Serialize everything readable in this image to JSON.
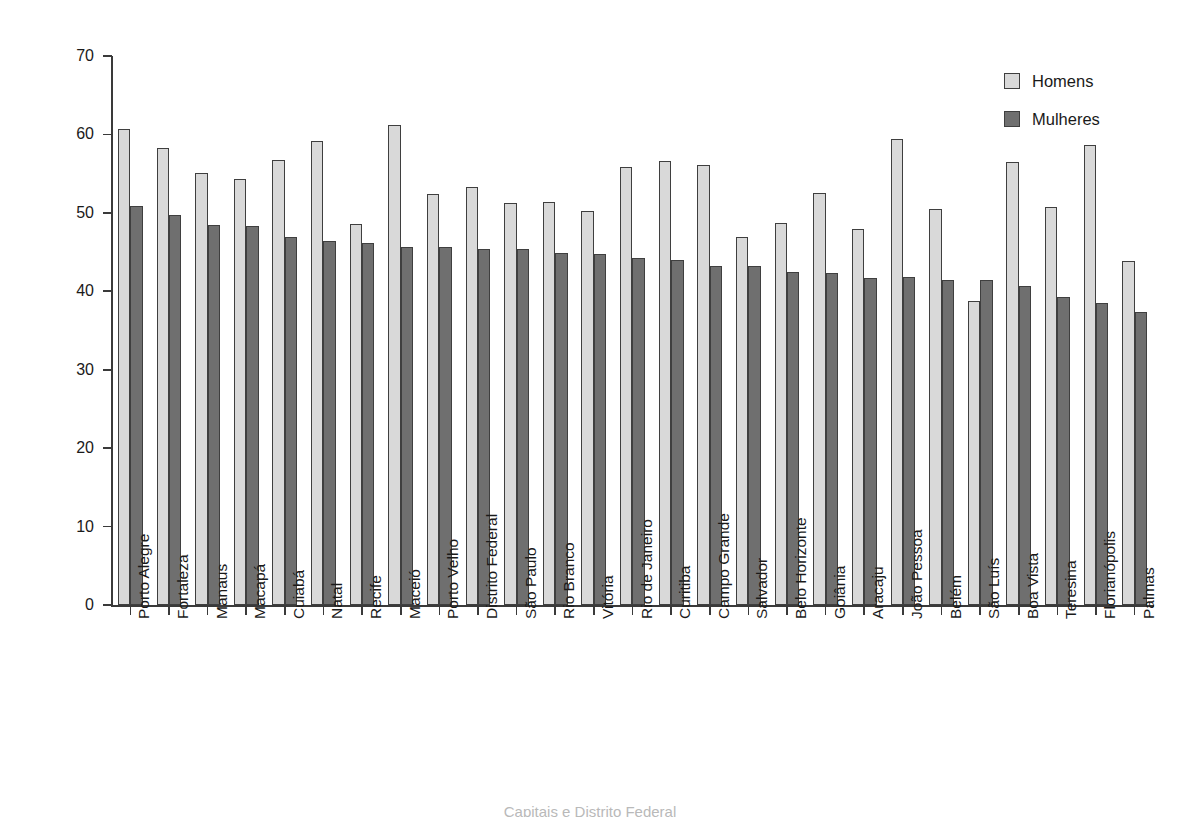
{
  "chart_data": {
    "type": "bar",
    "title": "",
    "subtitle": "",
    "xlabel": "",
    "ylabel": "Percentual",
    "ylim": [
      0,
      70
    ],
    "yticks": [
      0,
      10,
      20,
      30,
      40,
      50,
      60,
      70
    ],
    "grid": false,
    "legend_position": "top-right",
    "categories": [
      "Porto Alegre",
      "Fortaleza",
      "Manaus",
      "Macapá",
      "Cuiabá",
      "Natal",
      "Recife",
      "Maceió",
      "Porto Velho",
      "Distrito Federal",
      "São Paulo",
      "Rio Branco",
      "Vitória",
      "Rio de Janeiro",
      "Curitiba",
      "Campo Grande",
      "Salvador",
      "Belo Horizonte",
      "Goiânia",
      "Aracaju",
      "João Pessoa",
      "Belém",
      "São Luís",
      "Boa Vista",
      "Teresina",
      "Florianópolis",
      "Palmas"
    ],
    "series": [
      {
        "name": "Homens",
        "color": "#d9d9d9",
        "values": [
          60.7,
          58.3,
          55.1,
          54.3,
          56.8,
          59.2,
          48.6,
          61.2,
          52.4,
          53.3,
          51.2,
          51.4,
          50.3,
          55.9,
          56.6,
          56.1,
          46.9,
          48.7,
          52.5,
          47.9,
          59.4,
          50.5,
          38.7,
          56.5,
          50.7,
          58.7,
          43.8
        ]
      },
      {
        "name": "Mulheres",
        "color": "#6f6f6f",
        "values": [
          50.9,
          49.7,
          48.4,
          48.3,
          46.9,
          46.4,
          46.2,
          45.6,
          45.7,
          45.4,
          45.4,
          44.9,
          44.7,
          44.3,
          44.0,
          43.2,
          43.2,
          42.4,
          42.3,
          41.7,
          41.8,
          41.5,
          41.4,
          40.7,
          39.3,
          38.5,
          37.4
        ]
      }
    ]
  },
  "legend": {
    "items": [
      {
        "label": "Homens",
        "swatch": "homens"
      },
      {
        "label": "Mulheres",
        "swatch": "mulheres"
      }
    ]
  },
  "axes": {
    "y_title": "Percentual"
  },
  "caption": {
    "text": "Capitais e Distrito Federal"
  }
}
